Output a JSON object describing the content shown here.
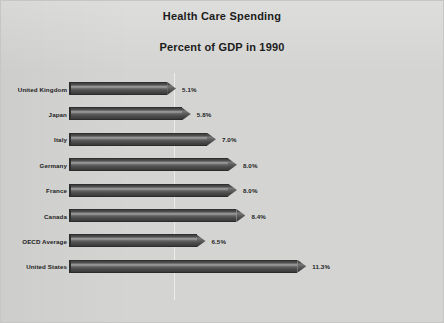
{
  "chart_data": {
    "type": "bar",
    "orientation": "horizontal",
    "title": "Health Care Spending",
    "subtitle": "Percent of GDP in 1990",
    "xlabel": "",
    "ylabel": "",
    "xlim": [
      0,
      12.5
    ],
    "grid": true,
    "gridlines": [
      5.0
    ],
    "legend": "none",
    "value_suffix": "%",
    "categories": [
      "United Kingdom",
      "Japan",
      "Italy",
      "Germany",
      "France",
      "Canada",
      "OECD Average",
      "United States"
    ],
    "values": [
      5.1,
      5.8,
      7.0,
      8.0,
      8.0,
      8.4,
      6.5,
      11.3
    ],
    "data_labels": [
      "5.1%",
      "5.8%",
      "7.0%",
      "8.0%",
      "8.0%",
      "8.4%",
      "6.5%",
      "11.3%"
    ],
    "series": [
      {
        "name": "Percent of GDP",
        "values": [
          5.1,
          5.8,
          7.0,
          8.0,
          8.0,
          8.4,
          6.5,
          11.3
        ]
      }
    ],
    "colors": {
      "background": "#d4d4d2",
      "border": "#c6c6c4",
      "bar": "#4a4a4a",
      "bar_highlight": "#a2a2a2",
      "text": "#232323",
      "gridline": "#ffffff"
    }
  }
}
